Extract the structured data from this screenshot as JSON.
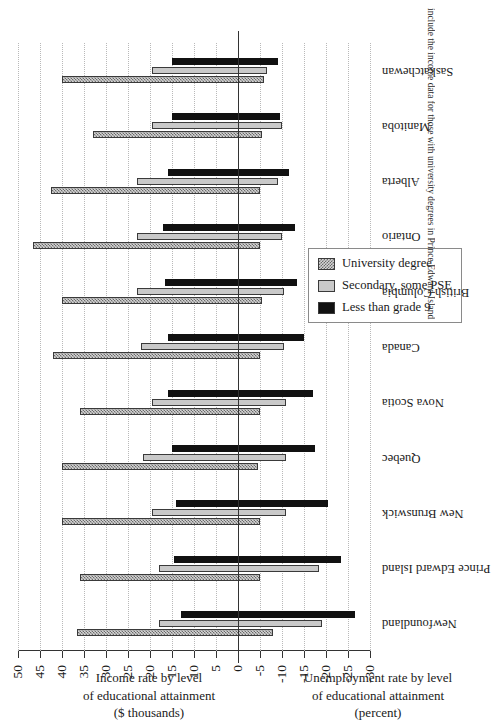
{
  "chart_data": {
    "type": "bar",
    "title": "",
    "orientation": "vertical-bars-rotated-90ccw",
    "categories": [
      "Newfoundland",
      "Prince Edward Island",
      "New Brunswick",
      "Quebec",
      "Nova Scotia",
      "Canada",
      "British Columbia",
      "Ontario",
      "Alberta",
      "Manitoba",
      "Saskatchewan"
    ],
    "series": [
      {
        "name": "University degree",
        "key": "uni",
        "pattern": "checkered-hatch",
        "color": "#d4d4d4",
        "income": [
          36.5,
          36.0,
          40.0,
          40.0,
          36.0,
          42.0,
          40.0,
          46.5,
          42.5,
          33.0,
          40.0
        ],
        "unemployment": [
          -8.0,
          -5.0,
          -5.0,
          -4.5,
          -5.0,
          -5.0,
          -5.5,
          -5.0,
          -5.0,
          -5.5,
          -6.0
        ]
      },
      {
        "name": "Secondary, some PSE",
        "key": "sec",
        "pattern": "solid",
        "color": "#c9c9c9",
        "income": [
          18.0,
          18.0,
          19.5,
          21.5,
          19.5,
          22.0,
          23.0,
          23.0,
          23.0,
          19.5,
          19.5
        ],
        "unemployment": [
          -19.0,
          -18.5,
          -11.0,
          -11.0,
          -11.0,
          -10.5,
          -10.5,
          -10.0,
          -9.0,
          -10.0,
          -6.5
        ]
      },
      {
        "name": "Less than grade 9",
        "key": "low",
        "pattern": "solid",
        "color": "#111111",
        "income": [
          13.0,
          14.5,
          14.0,
          15.0,
          16.0,
          16.0,
          16.5,
          17.0,
          16.0,
          15.0,
          15.0
        ],
        "unemployment": [
          -26.5,
          -23.5,
          -20.5,
          -17.5,
          -17.0,
          -15.0,
          -13.5,
          -13.0,
          -11.5,
          -9.5,
          -9.0
        ]
      }
    ],
    "axis": {
      "ticks": [
        -30,
        -25,
        -20,
        -15,
        -10,
        -5,
        0,
        5,
        10,
        15,
        20,
        25,
        30,
        35,
        40,
        45,
        50
      ],
      "min": -30,
      "max": 50,
      "grid": true,
      "zero_line": 0
    },
    "axis_titles": {
      "positive": [
        "Income rate by level",
        "of educational attainment",
        "($ thousands)"
      ],
      "negative": [
        "Unemployment rate by level",
        "of educational attainment",
        "(percent)"
      ]
    },
    "legend": {
      "position": "bottom-center-inset",
      "entries": [
        "University degree",
        "Secondary, some PSE",
        "Less than grade 9"
      ]
    }
  },
  "caption": "include the income data for those with university degrees in Prince Edward Island"
}
